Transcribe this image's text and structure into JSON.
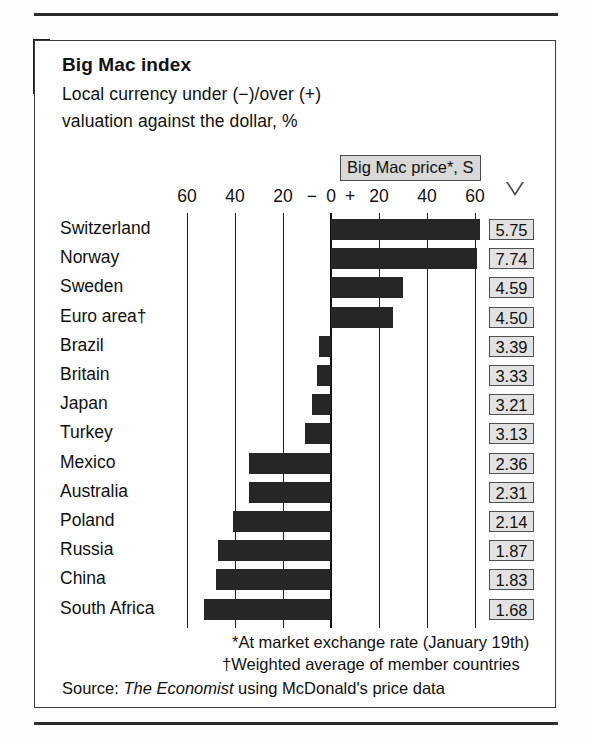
{
  "chart_data": {
    "type": "bar",
    "orientation": "horizontal",
    "title": "Big Mac index",
    "subtitle_line1": "Local currency under (−)/over (+)",
    "subtitle_line2": "valuation against the dollar, %",
    "xlabel": "",
    "ylabel": "",
    "xlim": [
      -70,
      70
    ],
    "grid": true,
    "axis_ticks": [
      {
        "label": "60",
        "value": -60
      },
      {
        "label": "40",
        "value": -40
      },
      {
        "label": "20",
        "value": -20
      },
      {
        "label": "−",
        "value": -8
      },
      {
        "label": "0",
        "value": 0
      },
      {
        "label": "+",
        "value": 8
      },
      {
        "label": "20",
        "value": 20
      },
      {
        "label": "40",
        "value": 40
      },
      {
        "label": "60",
        "value": 60
      }
    ],
    "gridline_values": [
      -60,
      -40,
      -20,
      0,
      20,
      40,
      60
    ],
    "categories": [
      "Switzerland",
      "Norway",
      "Sweden",
      "Euro area†",
      "Brazil",
      "Britain",
      "Japan",
      "Turkey",
      "Mexico",
      "Australia",
      "Poland",
      "Russia",
      "China",
      "South Africa"
    ],
    "values": [
      62,
      61,
      30,
      26,
      -5,
      -6,
      -8,
      -11,
      -34,
      -34,
      -41,
      -47,
      -48,
      -53
    ],
    "secondary_series": {
      "name": "Big Mac price*, $",
      "values": [
        "5.75",
        "7.74",
        "4.59",
        "4.50",
        "3.39",
        "3.33",
        "3.21",
        "3.13",
        "2.36",
        "2.31",
        "2.14",
        "1.87",
        "1.83",
        "1.68"
      ]
    },
    "callout_label": "Big Mac price*, S",
    "annotations": [
      "*At market exchange rate (January 19th)",
      "†Weighted average of member countries"
    ],
    "source_prefix": "Source: ",
    "source_italic": "The Economist",
    "source_suffix": " using McDonald's price data",
    "bar_color": "#262626",
    "box_fill": "#e2e2e2"
  },
  "rows": [
    {
      "label": "Switzerland",
      "value": 62,
      "price": "5.75"
    },
    {
      "label": "Norway",
      "value": 61,
      "price": "7.74"
    },
    {
      "label": "Sweden",
      "value": 30,
      "price": "4.59"
    },
    {
      "label": "Euro area†",
      "value": 26,
      "price": "4.50"
    },
    {
      "label": "Brazil",
      "value": -5,
      "price": "3.39"
    },
    {
      "label": "Britain",
      "value": -6,
      "price": "3.33"
    },
    {
      "label": "Japan",
      "value": -8,
      "price": "3.21"
    },
    {
      "label": "Turkey",
      "value": -11,
      "price": "3.13"
    },
    {
      "label": "Mexico",
      "value": -34,
      "price": "2.36"
    },
    {
      "label": "Australia",
      "value": -34,
      "price": "2.31"
    },
    {
      "label": "Poland",
      "value": -41,
      "price": "2.14"
    },
    {
      "label": "Russia",
      "value": -47,
      "price": "1.87"
    },
    {
      "label": "China",
      "value": -48,
      "price": "1.83"
    },
    {
      "label": "South Africa",
      "value": -53,
      "price": "1.68"
    }
  ]
}
